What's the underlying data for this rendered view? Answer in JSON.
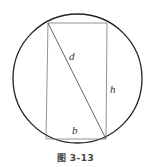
{
  "figure": {
    "caption": "图 3-13",
    "labels": {
      "diagonal": "d",
      "height": "h",
      "base": "b"
    },
    "shapes": {
      "circle": {
        "cx": 77.5,
        "cy": 78.5,
        "r": 64.5,
        "stroke": "#222222"
      },
      "rectangle": {
        "x1": 47,
        "y1": 23,
        "x2": 106,
        "y2": 139,
        "stroke": "#666666"
      },
      "diagonal": {
        "from": [
          48,
          23
        ],
        "to": [
          106,
          139
        ],
        "stroke": "#555555"
      }
    }
  }
}
